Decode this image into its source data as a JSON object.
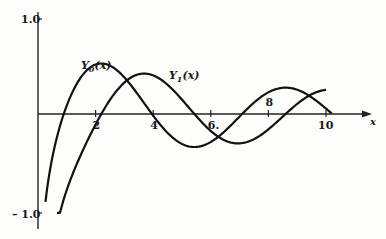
{
  "chart_data": {
    "type": "line",
    "title": "",
    "xlabel": "x",
    "ylabel": "",
    "xlim": [
      0,
      11.5
    ],
    "ylim": [
      -1.0,
      1.0
    ],
    "x_ticks": [
      2,
      4,
      6,
      8,
      10
    ],
    "x_tick_labels": [
      "2",
      "4",
      "6.",
      "8",
      "10"
    ],
    "y_ticks": [
      1.0,
      -1.0
    ],
    "y_tick_labels": [
      "1.0",
      "– 1.0"
    ],
    "grid": false,
    "legend": "inline annotations",
    "series": [
      {
        "name": "Y0(x)",
        "label": "Y₀(x)",
        "function": "bessel_y0",
        "x_range": [
          0.22,
          10.2
        ],
        "sample_points": [
          [
            0.5,
            -0.44
          ],
          [
            0.89,
            0.0
          ],
          [
            1.5,
            0.38
          ],
          [
            2.2,
            0.52
          ],
          [
            3.0,
            0.38
          ],
          [
            3.96,
            0.0
          ],
          [
            5.0,
            -0.31
          ],
          [
            5.43,
            -0.34
          ],
          [
            6.0,
            -0.29
          ],
          [
            7.09,
            0.0
          ],
          [
            8.0,
            0.22
          ],
          [
            8.6,
            0.27
          ],
          [
            9.0,
            0.25
          ],
          [
            10.0,
            0.06
          ]
        ]
      },
      {
        "name": "Y1(x)",
        "label": "Y₁(x)",
        "function": "bessel_y1",
        "x_range": [
          0.66,
          10.0
        ],
        "sample_points": [
          [
            0.66,
            -1.05
          ],
          [
            1.0,
            -0.78
          ],
          [
            2.0,
            -0.11
          ],
          [
            2.2,
            0.0
          ],
          [
            3.0,
            0.32
          ],
          [
            3.68,
            0.42
          ],
          [
            4.5,
            0.3
          ],
          [
            5.43,
            0.0
          ],
          [
            6.0,
            -0.18
          ],
          [
            6.94,
            -0.3
          ],
          [
            8.0,
            -0.16
          ],
          [
            8.6,
            0.0
          ],
          [
            9.0,
            0.1
          ],
          [
            10.0,
            0.25
          ]
        ]
      }
    ]
  },
  "labels": {
    "y0": "Y",
    "y0_sub": "0",
    "y0_arg": "(x)",
    "y1": "Y",
    "y1_sub": "1",
    "y1_arg": "(x)",
    "x_axis": "x",
    "ytick_top": "1.0",
    "ytick_bottom": "– 1.0",
    "xticks": [
      "2",
      "4",
      "6.",
      "8",
      "10"
    ]
  }
}
